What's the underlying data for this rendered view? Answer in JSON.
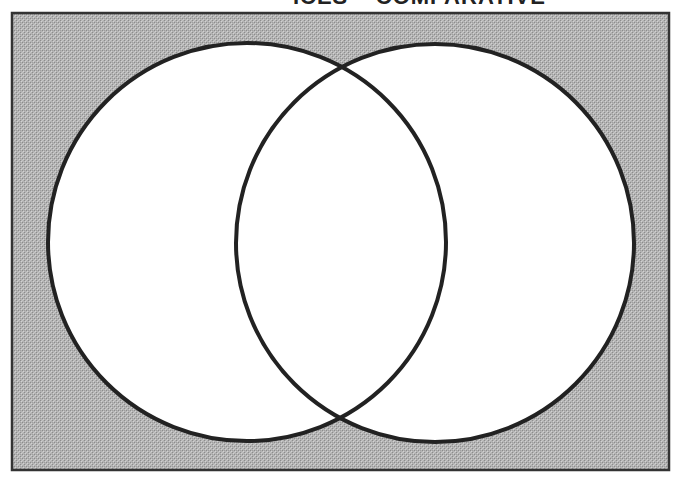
{
  "title": {
    "text": "ICES – COMPARATIVE",
    "visible": "clipped at top edge"
  },
  "diagram": {
    "type": "venn",
    "sets": [
      {
        "name": "left-circle",
        "cx": 247,
        "cy": 242,
        "r": 199
      },
      {
        "name": "right-circle",
        "cx": 435,
        "cy": 243,
        "r": 199
      }
    ],
    "frame": {
      "x": 12,
      "y": 13,
      "width": 657,
      "height": 457
    },
    "colors": {
      "background_fill": "#b4b4b4",
      "pattern_light": "#d2d2d2",
      "pattern_dark": "#8c8c8c",
      "circle_fill": "#ffffff",
      "stroke": "#222222",
      "frame_stroke": "#333333"
    },
    "labels": []
  }
}
